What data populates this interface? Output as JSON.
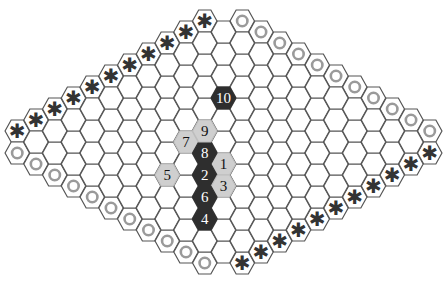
{
  "board": {
    "size": 11,
    "origin_x": 36,
    "origin_y": 142,
    "step_x": 18.75,
    "step_y": 11,
    "hex_radius": 12.2,
    "colors": {
      "grid_stroke": "#555555",
      "dark_stone": "#2e2e2e",
      "light_stone": "#cfcfcf",
      "ring": "#9a9a9a",
      "star": "#333333"
    },
    "border_markers": {
      "upper_left": "star",
      "lower_right": "star",
      "upper_right": "circle",
      "lower_left": "circle"
    },
    "moves": [
      {
        "n": "1",
        "i": 4,
        "j": 6,
        "color": "light"
      },
      {
        "n": "2",
        "i": 3,
        "j": 6,
        "color": "dark"
      },
      {
        "n": "3",
        "i": 3,
        "j": 7,
        "color": "light"
      },
      {
        "n": "4",
        "i": 1,
        "j": 8,
        "color": "dark"
      },
      {
        "n": "5",
        "i": 2,
        "j": 5,
        "color": "light"
      },
      {
        "n": "6",
        "i": 2,
        "j": 7,
        "color": "dark"
      },
      {
        "n": "7",
        "i": 4,
        "j": 4,
        "color": "light"
      },
      {
        "n": "8",
        "i": 4,
        "j": 5,
        "color": "dark"
      },
      {
        "n": "9",
        "i": 5,
        "j": 4,
        "color": "light"
      },
      {
        "n": "10",
        "i": 7,
        "j": 3,
        "color": "dark"
      }
    ]
  },
  "icons": {
    "star": "✱",
    "circle": "ring"
  }
}
